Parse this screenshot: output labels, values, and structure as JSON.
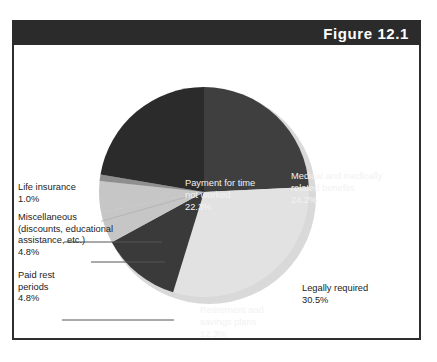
{
  "figure": {
    "number_label": "Figure 12.1"
  },
  "chart_data": {
    "type": "pie",
    "title": "Figure 12.1",
    "xlabel": "",
    "ylabel": "",
    "grid": false,
    "legend": "none (direct slice labels and leader-line callouts)",
    "start_angle_deg": 0,
    "direction": "clockwise",
    "categories": [
      "Medical and medically related benefits",
      "Legally required",
      "Retirement and savings plans",
      "Paid rest periods",
      "Miscellaneous (discounts, educational assistance, etc.)",
      "Life insurance",
      "Payment for time not worked"
    ],
    "values": [
      24.2,
      30.5,
      12.3,
      4.8,
      4.8,
      1.0,
      22.3
    ],
    "units": "percent",
    "slices": [
      {
        "name": "Medical and medically related benefits",
        "value": 24.2,
        "value_label": "24.2%",
        "label_line1": "Medical and medically",
        "label_line2": "related benefits",
        "color": "#3f3f3f",
        "label_placement": "inside",
        "label_color": "#f2f2f2"
      },
      {
        "name": "Legally required",
        "value": 30.5,
        "value_label": "30.5%",
        "label_line1": "Legally required",
        "label_line2": "",
        "color": "#e2e2e2",
        "label_placement": "inside",
        "label_color": "#1b1b1b"
      },
      {
        "name": "Retirement and savings plans",
        "value": 12.3,
        "value_label": "12.3%",
        "label_line1": "Retirement and",
        "label_line2": "savings plans",
        "color": "#3a3a3a",
        "label_placement": "inside",
        "label_color": "#f2f2f2"
      },
      {
        "name": "Paid rest periods",
        "value": 4.8,
        "value_label": "4.8%",
        "label_line1": "Paid rest",
        "label_line2": "periods",
        "color": "#c6c6c6",
        "label_placement": "callout",
        "label_color": "#1c1c1c"
      },
      {
        "name": "Miscellaneous (discounts, educational assistance, etc.)",
        "value": 4.8,
        "value_label": "4.8%",
        "label_line1": "Miscellaneous",
        "label_line2": "(discounts, educational",
        "label_line3": "assistance, etc.)",
        "color": "#c6c6c6",
        "label_placement": "callout",
        "label_color": "#1c1c1c"
      },
      {
        "name": "Life insurance",
        "value": 1.0,
        "value_label": "1.0%",
        "label_line1": "Life insurance",
        "label_line2": "",
        "color": "#8f8f8f",
        "label_placement": "callout",
        "label_color": "#1c1c1c"
      },
      {
        "name": "Payment for time not worked",
        "value": 22.3,
        "value_label": "22.3%",
        "label_line1": "Payment for time",
        "label_line2": "not worked",
        "color": "#2b2b2b",
        "label_placement": "inside",
        "label_color": "#f2f2f2"
      }
    ]
  },
  "slice_labels": {
    "medical": "Medical and medically\nrelated benefits\n24.2%",
    "payment": "Payment for time\nnot worked\n22.3%",
    "legally": "Legally required\n30.5%",
    "retirement": "Retirement and\nsavings plans\n12.3%"
  },
  "callouts": {
    "life_insurance": "Life insurance\n1.0%",
    "miscellaneous": "Miscellaneous\n(discounts, educational\nassistance, etc.)\n4.8%",
    "paid_rest": "Paid rest\nperiods\n4.8%"
  },
  "colors": {
    "frame": "#2e2e2e",
    "header_band": "#2b2b2b",
    "header_text": "#ffffff",
    "background": "#ffffff",
    "leader_line": "#555555",
    "slice_payment": "#2b2b2b",
    "slice_medical": "#3f3f3f",
    "slice_legally": "#e2e2e2",
    "slice_retirement": "#3a3a3a",
    "slice_paid_rest": "#c6c6c6",
    "slice_miscellaneous": "#c6c6c6",
    "slice_life_insurance": "#8f8f8f"
  }
}
